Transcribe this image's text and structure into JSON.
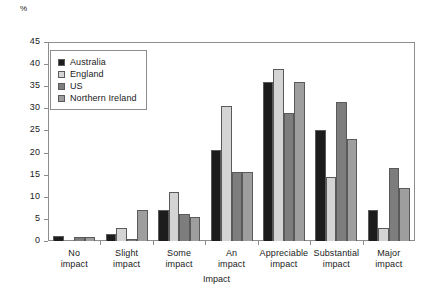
{
  "chart_data": {
    "type": "bar",
    "title": "",
    "xlabel": "Impact",
    "ylabel": "%",
    "ylim": [
      0,
      45
    ],
    "yticks": [
      0,
      5,
      10,
      15,
      20,
      25,
      30,
      35,
      40,
      45
    ],
    "grid": false,
    "legend_position": "top-left",
    "categories": [
      "No impact",
      "Slight impact",
      "Some impact",
      "An impact",
      "Appreciable impact",
      "Substantial impact",
      "Major impact"
    ],
    "category_lines": [
      [
        "No",
        "impact"
      ],
      [
        "Slight",
        "impact"
      ],
      [
        "Some",
        "impact"
      ],
      [
        "An",
        "impact"
      ],
      [
        "Appreciable",
        "impact"
      ],
      [
        "Substantial",
        "impact"
      ],
      [
        "Major",
        "impact"
      ]
    ],
    "series": [
      {
        "name": "Australia",
        "color": "#1c1c1c",
        "values": [
          1.2,
          1.5,
          7.0,
          20.5,
          36.0,
          25.0,
          7.0
        ]
      },
      {
        "name": "England",
        "color": "#d4d4d4",
        "values": [
          0.0,
          3.0,
          11.0,
          30.5,
          39.0,
          14.5,
          3.0
        ]
      },
      {
        "name": "US",
        "color": "#7d7d7d",
        "values": [
          1.0,
          0.5,
          6.0,
          15.5,
          29.0,
          31.5,
          16.5
        ]
      },
      {
        "name": "Northern Ireland",
        "color": "#9e9e9e",
        "values": [
          1.0,
          7.0,
          5.5,
          15.5,
          36.0,
          23.0,
          12.0
        ]
      }
    ]
  }
}
